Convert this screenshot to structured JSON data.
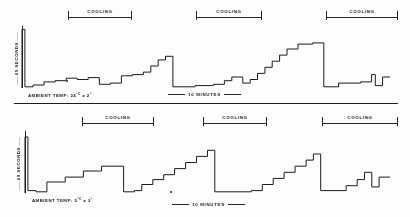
{
  "figure": {
    "panels": [
      {
        "id": "upper",
        "yaxis_label": "60 SECONDS",
        "ambient_label": "AMBIENT TEMP:",
        "ambient_value": "24",
        "ambient_unit": "°C",
        "ambient_tolerance": "± 2",
        "ambient_tolerance_unit": "°",
        "ambient_full": "AMBIENT TEMP: 24°C ± 2°",
        "xscale_label": "10 MINUTES",
        "brackets": [
          {
            "label": "COOLING"
          },
          {
            "label": "COOLING"
          },
          {
            "label": "COOLING"
          }
        ]
      },
      {
        "id": "lower",
        "yaxis_label": "60 SECONDS",
        "ambient_label": "AMBIENT TEMP:",
        "ambient_value": "5",
        "ambient_unit": "°C",
        "ambient_tolerance": "± 2",
        "ambient_tolerance_unit": "°",
        "ambient_full": "AMBIENT TEMP: 5°C ± 2°",
        "xscale_label": "10 MINUTES",
        "brackets": [
          {
            "label": "COOLING"
          },
          {
            "label": "COOLING"
          },
          {
            "label": "COOLING"
          }
        ]
      }
    ]
  },
  "chart_data": [
    {
      "type": "line",
      "id": "upper-panel-trace",
      "title": "Defrost interval vs time — ambient 24°C ± 2°",
      "xlabel": "10 MINUTES",
      "ylabel": "60 SECONDS",
      "grid": false,
      "legend": null,
      "xlim": [
        0,
        100
      ],
      "ylim": [
        0,
        100
      ],
      "annotations": [
        "COOLING",
        "COOLING",
        "COOLING"
      ],
      "description": "Three sawtooth defrost cycles; staircase rise then vertical reset to baseline.",
      "series": [
        {
          "name": "defrost interval",
          "points": [
            [
              0.0,
              0.0
            ],
            [
              0.0,
              96.0
            ],
            [
              0.8,
              96.0
            ],
            [
              0.8,
              2.0
            ],
            [
              3.0,
              2.0
            ],
            [
              3.0,
              5.0
            ],
            [
              6.0,
              5.0
            ],
            [
              6.0,
              10.0
            ],
            [
              9.0,
              10.0
            ],
            [
              9.0,
              12.0
            ],
            [
              12.0,
              12.0
            ],
            [
              12.0,
              16.0
            ],
            [
              15.0,
              16.0
            ],
            [
              15.0,
              14.0
            ],
            [
              18.0,
              14.0
            ],
            [
              18.0,
              17.0
            ],
            [
              21.0,
              17.0
            ],
            [
              21.0,
              6.0
            ],
            [
              24.0,
              6.0
            ],
            [
              24.0,
              8.0
            ],
            [
              27.0,
              8.0
            ],
            [
              27.0,
              20.0
            ],
            [
              30.0,
              20.0
            ],
            [
              30.0,
              22.0
            ],
            [
              33.0,
              22.0
            ],
            [
              33.0,
              26.0
            ],
            [
              35.0,
              26.0
            ],
            [
              35.0,
              36.0
            ],
            [
              37.0,
              36.0
            ],
            [
              37.0,
              46.0
            ],
            [
              39.0,
              46.0
            ],
            [
              39.0,
              52.0
            ],
            [
              41.0,
              52.0
            ],
            [
              41.0,
              2.0
            ],
            [
              47.0,
              2.0
            ],
            [
              47.0,
              4.0
            ],
            [
              52.0,
              4.0
            ],
            [
              52.0,
              6.0
            ],
            [
              55.0,
              6.0
            ],
            [
              55.0,
              12.0
            ],
            [
              57.0,
              12.0
            ],
            [
              57.0,
              18.0
            ],
            [
              60.0,
              18.0
            ],
            [
              60.0,
              8.0
            ],
            [
              62.0,
              8.0
            ],
            [
              62.0,
              14.0
            ],
            [
              64.0,
              14.0
            ],
            [
              64.0,
              24.0
            ],
            [
              66.0,
              24.0
            ],
            [
              66.0,
              34.0
            ],
            [
              68.0,
              34.0
            ],
            [
              68.0,
              44.0
            ],
            [
              70.0,
              44.0
            ],
            [
              70.0,
              54.0
            ],
            [
              72.0,
              54.0
            ],
            [
              72.0,
              64.0
            ],
            [
              75.0,
              64.0
            ],
            [
              75.0,
              72.0
            ],
            [
              79.0,
              72.0
            ],
            [
              79.0,
              74.0
            ],
            [
              82.0,
              74.0
            ],
            [
              82.0,
              2.0
            ],
            [
              86.0,
              2.0
            ],
            [
              86.0,
              8.0
            ],
            [
              92.0,
              8.0
            ],
            [
              92.0,
              10.0
            ],
            [
              95.0,
              10.0
            ],
            [
              95.0,
              22.0
            ],
            [
              96.0,
              22.0
            ],
            [
              96.0,
              4.0
            ],
            [
              98.0,
              4.0
            ],
            [
              98.0,
              18.0
            ],
            [
              100.0,
              18.0
            ]
          ]
        }
      ]
    },
    {
      "type": "line",
      "id": "lower-panel-trace",
      "title": "Defrost interval vs time — ambient 5°C ± 2°",
      "xlabel": "10 MINUTES",
      "ylabel": "60 SECONDS",
      "grid": false,
      "legend": null,
      "xlim": [
        0,
        100
      ],
      "ylim": [
        0,
        100
      ],
      "annotations": [
        "COOLING",
        "COOLING",
        "COOLING"
      ],
      "description": "Three sawtooth defrost cycles with larger, more regular steps than the upper panel.",
      "series": [
        {
          "name": "defrost interval",
          "points": [
            [
              0.0,
              0.0
            ],
            [
              0.0,
              92.0
            ],
            [
              0.8,
              92.0
            ],
            [
              0.8,
              4.0
            ],
            [
              3.0,
              4.0
            ],
            [
              3.0,
              2.0
            ],
            [
              6.0,
              2.0
            ],
            [
              6.0,
              18.0
            ],
            [
              11.0,
              18.0
            ],
            [
              11.0,
              26.0
            ],
            [
              16.0,
              26.0
            ],
            [
              16.0,
              36.0
            ],
            [
              21.0,
              36.0
            ],
            [
              21.0,
              44.0
            ],
            [
              27.0,
              44.0
            ],
            [
              27.0,
              2.0
            ],
            [
              30.0,
              2.0
            ],
            [
              30.0,
              4.0
            ],
            [
              32.0,
              4.0
            ],
            [
              32.0,
              14.0
            ],
            [
              35.0,
              14.0
            ],
            [
              35.0,
              22.0
            ],
            [
              38.0,
              22.0
            ],
            [
              38.0,
              30.0
            ],
            [
              41.0,
              30.0
            ],
            [
              41.0,
              40.0
            ],
            [
              44.0,
              40.0
            ],
            [
              44.0,
              50.0
            ],
            [
              47.0,
              50.0
            ],
            [
              47.0,
              60.0
            ],
            [
              50.0,
              60.0
            ],
            [
              50.0,
              70.0
            ],
            [
              52.0,
              70.0
            ],
            [
              52.0,
              2.0
            ],
            [
              62.0,
              2.0
            ],
            [
              62.0,
              4.0
            ],
            [
              65.0,
              4.0
            ],
            [
              65.0,
              14.0
            ],
            [
              68.0,
              14.0
            ],
            [
              68.0,
              24.0
            ],
            [
              71.0,
              24.0
            ],
            [
              71.0,
              34.0
            ],
            [
              74.0,
              34.0
            ],
            [
              74.0,
              44.0
            ],
            [
              77.0,
              44.0
            ],
            [
              77.0,
              54.0
            ],
            [
              79.0,
              54.0
            ],
            [
              79.0,
              64.0
            ],
            [
              81.0,
              64.0
            ],
            [
              81.0,
              4.0
            ],
            [
              88.0,
              4.0
            ],
            [
              88.0,
              12.0
            ],
            [
              91.0,
              12.0
            ],
            [
              91.0,
              22.0
            ],
            [
              93.0,
              22.0
            ],
            [
              93.0,
              34.0
            ],
            [
              95.0,
              34.0
            ],
            [
              95.0,
              10.0
            ],
            [
              97.0,
              10.0
            ],
            [
              97.0,
              26.0
            ],
            [
              100.0,
              26.0
            ]
          ]
        }
      ]
    }
  ]
}
